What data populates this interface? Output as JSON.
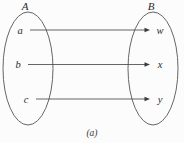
{
  "figure": {
    "caption": "(a)",
    "background_color": "#fcfcfc",
    "stroke_color": "#555555",
    "text_color": "#2b2b2b",
    "arrow_color": "#4a4a4a"
  },
  "domain_set": {
    "label": "A",
    "label_x": 25,
    "label_y": 10,
    "ellipse": {
      "cx": 28,
      "cy": 68.5,
      "rx": 25,
      "ry": 56.5
    },
    "elements": [
      {
        "name": "a",
        "x": 20,
        "y": 33.5
      },
      {
        "name": "b",
        "x": 18,
        "y": 68
      },
      {
        "name": "c",
        "x": 26,
        "y": 102.5
      }
    ]
  },
  "codomain_set": {
    "label": "B",
    "label_x": 151,
    "label_y": 10,
    "ellipse": {
      "cx": 153,
      "cy": 68.5,
      "rx": 25,
      "ry": 56.5
    },
    "elements": [
      {
        "name": "w",
        "x": 160,
        "y": 33.5
      },
      {
        "name": "x",
        "x": 160,
        "y": 68
      },
      {
        "name": "y",
        "x": 160,
        "y": 102.5
      }
    ]
  },
  "mappings": [
    {
      "from": "a",
      "to": "w",
      "x1": 30,
      "x2": 150,
      "y": 30
    },
    {
      "from": "b",
      "to": "x",
      "x1": 28,
      "x2": 150,
      "y": 64.5
    },
    {
      "from": "c",
      "to": "y",
      "x1": 36,
      "x2": 150,
      "y": 99
    }
  ]
}
